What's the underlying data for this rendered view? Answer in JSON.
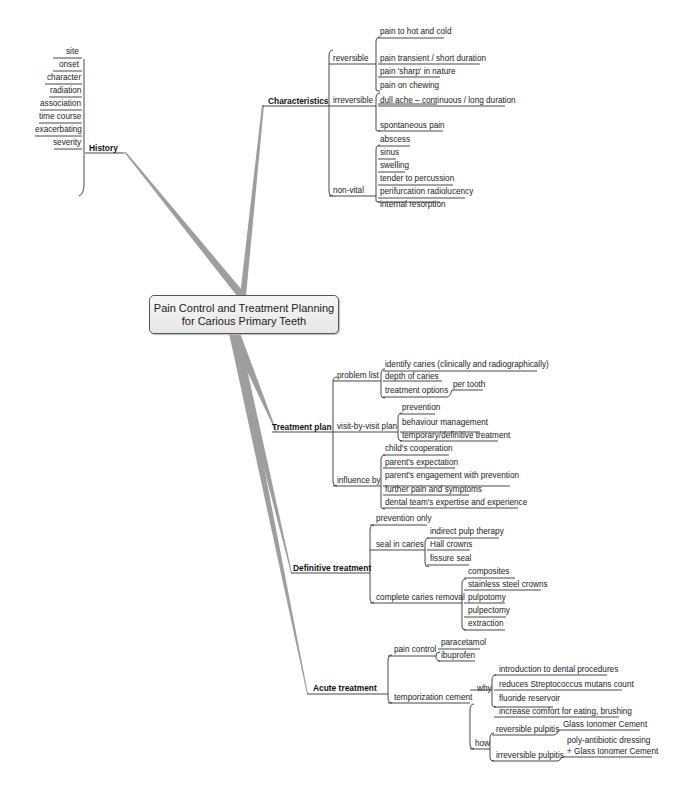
{
  "center": {
    "title_line1": "Pain Control and Treatment Planning",
    "title_line2": "for Carious Primary Teeth"
  },
  "history": {
    "label": "History",
    "items": [
      "site",
      "onset",
      "character",
      "radiation",
      "association",
      "time course",
      "exacerbating",
      "severity"
    ]
  },
  "characteristics": {
    "label": "Characteristics",
    "reversible": {
      "label": "reversible",
      "items": [
        "pain to hot and cold",
        "pain transient / short duration",
        "pain 'sharp' in nature"
      ]
    },
    "irreversible": {
      "label": "irreversible",
      "items": [
        "pain on chewing",
        "dull ache – continuous / long duration",
        "spontaneous pain"
      ]
    },
    "non_vital": {
      "label": "non-vital",
      "items": [
        "abscess",
        "sinus",
        "swelling",
        "tender to percussion",
        "perifurcation radiolucency",
        "internal resorption"
      ]
    }
  },
  "treatment_plan": {
    "label": "Treatment plan",
    "problem_list": {
      "label": "problem list",
      "items": [
        "identify caries (clinically and radiographically)",
        "depth of caries",
        "treatment options"
      ],
      "per_tooth": "per tooth"
    },
    "visit_plan": {
      "label": "visit-by-visit plan",
      "items": [
        "prevention",
        "behaviour management",
        "temporary/definitive treatment"
      ]
    },
    "influence_by": {
      "label": "influence by",
      "items": [
        "child's cooperation",
        "parent's expectation",
        "parent's engagement with prevention",
        "further pain and symptoms",
        "dental team's expertise and experience"
      ]
    }
  },
  "definitive_treatment": {
    "label": "Definitive treatment",
    "prevention_only": "prevention only",
    "seal_in_caries": {
      "label": "seal in caries",
      "items": [
        "indirect pulp therapy",
        "Hall crowns",
        "fissure seal"
      ]
    },
    "complete_removal": {
      "label": "complete caries removal",
      "items": [
        "composites",
        "stainless steel crowns",
        "pulpotomy",
        "pulpectomy",
        "extraction"
      ]
    }
  },
  "acute_treatment": {
    "label": "Acute treatment",
    "pain_control": {
      "label": "pain control",
      "items": [
        "paracetamol",
        "ibuprofen"
      ]
    },
    "temporization": {
      "label": "temporization cement",
      "why": {
        "label": "why",
        "items": [
          "introduction to dental procedures",
          "reduces Streptococcus mutans count",
          "fluoride reservoir",
          "increase comfort for eating, brushing"
        ]
      },
      "how": {
        "label": "how",
        "reversible": {
          "label": "reversible pulpitis",
          "value": "Glass Ionomer Cement"
        },
        "irreversible": {
          "label": "irreversible pulpitis",
          "value_line1": "poly-antibiotic dressing",
          "value_line2": "+ Glass Ionomer Cement"
        }
      }
    }
  },
  "colors": {
    "trunk": "#9a9a9a",
    "line": "#333333",
    "box_bg": "#eeeeee"
  }
}
